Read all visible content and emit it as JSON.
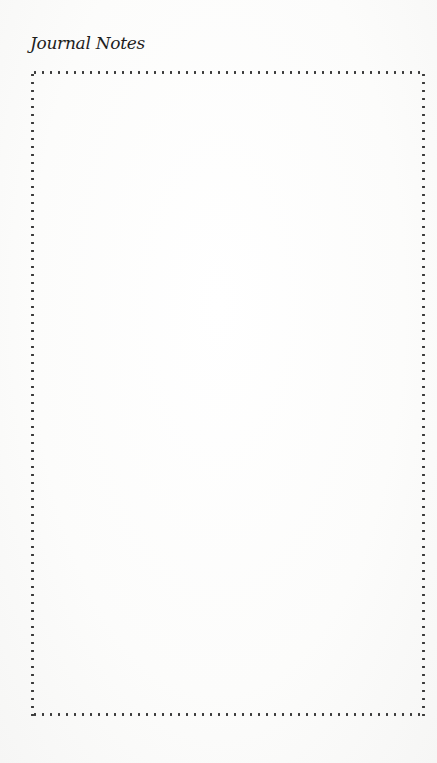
{
  "page": {
    "title": "Journal Notes",
    "notes": {
      "content": "",
      "border_style": "dotted",
      "border_color": "#3a3a3a"
    }
  }
}
